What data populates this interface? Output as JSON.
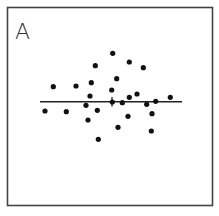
{
  "panel": {
    "label": "A",
    "frame_color": "#444444",
    "dot_color": "#111111"
  },
  "chart_data": {
    "type": "scatter",
    "title": "A",
    "xlabel": "",
    "ylabel": "",
    "grid": false,
    "legend": null,
    "reference_line": {
      "orientation": "horizontal",
      "y": 101.7,
      "x_from": 40,
      "x_to": 182,
      "tick_x": 112
    },
    "points": [
      {
        "x": 95.3,
        "y": 65.7
      },
      {
        "x": 53.3,
        "y": 86.7
      },
      {
        "x": 76.0,
        "y": 86.0
      },
      {
        "x": 91.3,
        "y": 82.7
      },
      {
        "x": 90.0,
        "y": 96.0
      },
      {
        "x": 86.0,
        "y": 105.3
      },
      {
        "x": 45.0,
        "y": 111.0
      },
      {
        "x": 66.3,
        "y": 111.7
      },
      {
        "x": 97.3,
        "y": 110.3
      },
      {
        "x": 88.0,
        "y": 120.0
      },
      {
        "x": 98.3,
        "y": 139.3
      },
      {
        "x": 112.7,
        "y": 53.3
      },
      {
        "x": 129.3,
        "y": 62.0
      },
      {
        "x": 143.3,
        "y": 67.7
      },
      {
        "x": 116.7,
        "y": 78.7
      },
      {
        "x": 111.7,
        "y": 90.0
      },
      {
        "x": 129.3,
        "y": 97.3
      },
      {
        "x": 137.0,
        "y": 94.0
      },
      {
        "x": 170.3,
        "y": 97.3
      },
      {
        "x": 112.3,
        "y": 102.0
      },
      {
        "x": 122.3,
        "y": 102.7
      },
      {
        "x": 146.7,
        "y": 104.3
      },
      {
        "x": 155.7,
        "y": 101.3
      },
      {
        "x": 128.0,
        "y": 116.3
      },
      {
        "x": 152.0,
        "y": 113.7
      },
      {
        "x": 118.0,
        "y": 127.3
      },
      {
        "x": 151.3,
        "y": 131.0
      }
    ]
  }
}
